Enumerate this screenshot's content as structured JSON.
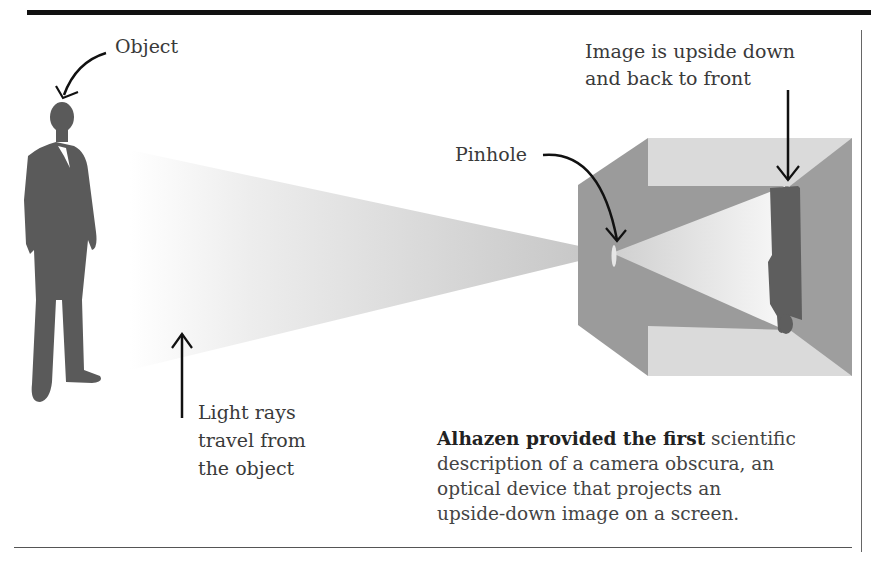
{
  "labels": {
    "object": "Object",
    "image_note_line1": "Image is upside down",
    "image_note_line2": "and back to front",
    "pinhole": "Pinhole",
    "light_rays_line1": "Light rays",
    "light_rays_line2": "travel from",
    "light_rays_line3": "the object"
  },
  "caption": {
    "bold": "Alhazen provided the first",
    "line1_rest": " scientific",
    "line2": "description of a camera obscura, an",
    "line3": "optical device that projects an",
    "line4": "upside-down image on a screen."
  },
  "colors": {
    "silhouette": "#5a5a5a",
    "box_dark": "#9a9a9a",
    "box_light": "#d9d9d9",
    "cone": "#c8c8c8",
    "arrow": "#111111"
  }
}
